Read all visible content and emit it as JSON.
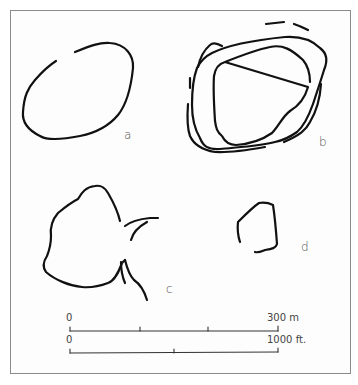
{
  "figure": {
    "panels": [
      {
        "id": "a",
        "label": "a"
      },
      {
        "id": "b",
        "label": "b"
      },
      {
        "id": "c",
        "label": "c"
      },
      {
        "id": "d",
        "label": "d"
      }
    ],
    "scale": {
      "metric": {
        "start": "0",
        "end": "300 m",
        "ticks": 4
      },
      "imperial": {
        "start": "0",
        "end": "1000 ft.",
        "ticks": 3
      }
    },
    "colors": {
      "line": "#111111",
      "frame": "#8a8a8a",
      "label": "#555555"
    }
  }
}
